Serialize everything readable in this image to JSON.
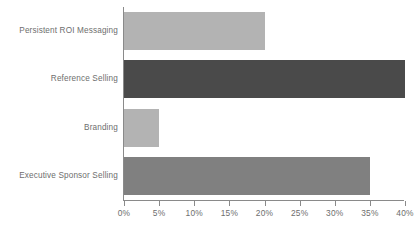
{
  "chart_data": {
    "type": "bar",
    "orientation": "horizontal",
    "title": "",
    "subtitle": "",
    "xlabel": "",
    "ylabel": "",
    "categories": [
      "Persistent ROI Messaging",
      "Reference Selling",
      "Branding",
      "Executive Sponsor Selling"
    ],
    "values": [
      20,
      40,
      5,
      35
    ],
    "value_labels": [
      "20%",
      "40%",
      "5%",
      "35%"
    ],
    "bar_colors": [
      "#b3b3b3",
      "#4a4a4a",
      "#b3b3b3",
      "#808080"
    ],
    "xlim": [
      0,
      40
    ],
    "xticks": [
      0,
      5,
      10,
      15,
      20,
      25,
      30,
      35,
      40
    ],
    "xtick_labels": [
      "0%",
      "5%",
      "10%",
      "15%",
      "20%",
      "25%",
      "30%",
      "35%",
      "40%"
    ],
    "grid": false,
    "legend": null,
    "legend_position": "none",
    "axis_color": "#8a8a8a",
    "label_color": "#6e6e6e",
    "background_color": "#ffffff"
  }
}
